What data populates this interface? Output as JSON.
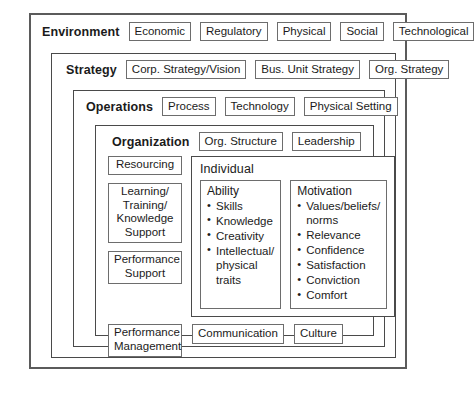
{
  "diagram": {
    "type": "nested-framework",
    "layers": [
      {
        "id": "environment",
        "title": "Environment",
        "tags": [
          "Economic",
          "Regulatory",
          "Physical",
          "Social",
          "Technological"
        ]
      },
      {
        "id": "strategy",
        "title": "Strategy",
        "tags": [
          "Corp. Strategy/Vision",
          "Bus. Unit Strategy",
          "Org. Strategy"
        ]
      },
      {
        "id": "operations",
        "title": "Operations",
        "tags": [
          "Process",
          "Technology",
          "Physical Setting"
        ]
      },
      {
        "id": "organization",
        "title": "Organization",
        "tags": [
          "Org. Structure",
          "Leadership"
        ]
      }
    ],
    "support_column": [
      "Resourcing",
      "Learning/\nTraining/\nKnowledge\nSupport",
      "Performance\nSupport"
    ],
    "individual": {
      "title": "Individual",
      "columns": [
        {
          "title": "Ability",
          "items": [
            "Skills",
            "Knowledge",
            "Creativity",
            "Intellectual/\nphysical traits"
          ]
        },
        {
          "title": "Motivation",
          "items": [
            "Values/beliefs/\nnorms",
            "Relevance",
            "Confidence",
            "Satisfaction",
            "Conviction",
            "Comfort"
          ]
        }
      ]
    },
    "enablers": [
      "Performance\nManagement",
      "Communication",
      "Culture"
    ],
    "colors": {
      "outer_border": "#5b5b5b",
      "layer_border": "#4a4a4a",
      "tag_border": "#6d6d6d",
      "background": "#ffffff",
      "text": "#1b1b1b"
    }
  }
}
